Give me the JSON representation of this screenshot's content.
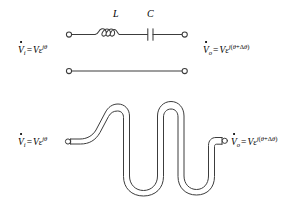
{
  "figure": {
    "background_color": "#ffffff",
    "stroke_color": "#3c3c3c",
    "text_color": "#000000",
    "width": 290,
    "height": 199
  },
  "panels": [
    {
      "id": "lc-network",
      "name": "lumped-lc-circuit",
      "components": [
        {
          "type": "terminal",
          "name": "input-terminal"
        },
        {
          "type": "inductor",
          "name": "inductor",
          "label": "L",
          "loops": 3
        },
        {
          "type": "capacitor",
          "name": "capacitor",
          "label": "C",
          "plates": 2
        },
        {
          "type": "terminal",
          "name": "output-terminal"
        }
      ],
      "input_label": {
        "dotvar": "V",
        "sub": "i",
        "eq": "=",
        "amplitude": "V",
        "base": "ε",
        "exponent_j": "j",
        "exponent_rest": "θ"
      },
      "output_label": {
        "dotvar": "V",
        "sub": "o",
        "eq": "=",
        "amplitude": "V",
        "base": "ε",
        "exponent_j": "j",
        "exponent_open": "(",
        "exponent_theta": "θ",
        "exponent_plus": "+",
        "exponent_delta": "Δ",
        "exponent_theta2": "θ",
        "exponent_close": ")"
      }
    },
    {
      "id": "straight-line",
      "name": "straight-transmission-line",
      "components": [
        {
          "type": "terminal",
          "name": "input-terminal"
        },
        {
          "type": "wire",
          "name": "straight-wire"
        },
        {
          "type": "terminal",
          "name": "output-terminal"
        }
      ]
    },
    {
      "id": "meander-line",
      "name": "meander-delay-line",
      "components": [
        {
          "type": "terminal",
          "name": "input-terminal"
        },
        {
          "type": "trace",
          "name": "serpentine-trace",
          "turns": 4
        },
        {
          "type": "terminal",
          "name": "output-terminal"
        }
      ],
      "input_label": {
        "dotvar": "V",
        "sub": "i",
        "eq": "=",
        "amplitude": "V",
        "base": "ε",
        "exponent_j": "j",
        "exponent_rest": "θ"
      },
      "output_label": {
        "dotvar": "V",
        "sub": "o",
        "eq": "=",
        "amplitude": "V",
        "base": "ε",
        "exponent_j": "j",
        "exponent_open": "(",
        "exponent_theta": "θ",
        "exponent_plus": "+",
        "exponent_delta": "Δ",
        "exponent_theta2": "θ",
        "exponent_close": ")"
      }
    }
  ],
  "labels": {
    "inductor": "L",
    "capacitor": "C"
  }
}
